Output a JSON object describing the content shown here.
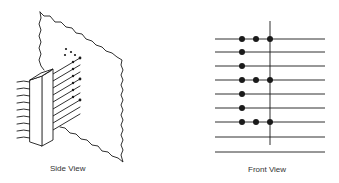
{
  "labels": {
    "side": "Side View",
    "front": "Front View"
  },
  "colors": {
    "ink": "#1a1a1a",
    "background": "#ffffff"
  },
  "front_view": {
    "line_x_start": 215,
    "line_x_end": 325,
    "horizontal_lines_y": [
      39,
      52,
      66,
      80,
      94,
      108,
      122,
      137,
      152
    ],
    "vertical_line": {
      "x": 270,
      "y1": 21,
      "y2": 145
    },
    "dot_columns_x": [
      242,
      256,
      270
    ],
    "dots": [
      {
        "row": 0,
        "cols": [
          0,
          1,
          2
        ]
      },
      {
        "row": 1,
        "cols": [
          0
        ]
      },
      {
        "row": 2,
        "cols": [
          0
        ]
      },
      {
        "row": 3,
        "cols": [
          0,
          1,
          2
        ]
      },
      {
        "row": 4,
        "cols": [
          0
        ]
      },
      {
        "row": 5,
        "cols": [
          0
        ]
      },
      {
        "row": 6,
        "cols": [
          0,
          1,
          2
        ]
      }
    ]
  },
  "side_view": {
    "left_wire_count": 9,
    "right_wire_count": 9
  }
}
